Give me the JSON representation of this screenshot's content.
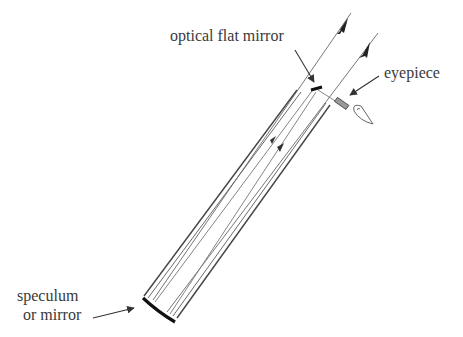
{
  "diagram": {
    "labels": {
      "optical_flat_mirror": "optical flat mirror",
      "eyepiece": "eyepiece",
      "speculum_line1": "speculum",
      "speculum_line2": "or mirror"
    },
    "colors": {
      "line": "#444444",
      "ray": "#777777",
      "text": "#3a3a3a",
      "mirror": "#111111"
    }
  }
}
